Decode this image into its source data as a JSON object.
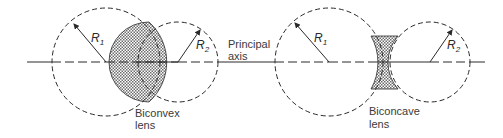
{
  "figure": {
    "axis_label_line1": "Principal",
    "axis_label_line2": "axis",
    "biconvex": {
      "label_line1": "Biconvex",
      "label_line2": "lens",
      "r1": {
        "letter": "R",
        "sub": "1"
      },
      "r2": {
        "letter": "R",
        "sub": "2"
      }
    },
    "biconcave": {
      "label_line1": "Biconcave",
      "label_line2": "lens",
      "r1": {
        "letter": "R",
        "sub": "1"
      },
      "r2": {
        "letter": "R",
        "sub": "2"
      }
    },
    "colors": {
      "line": "#2a2a2a",
      "lens_fill_dark": "#7a7a7a",
      "lens_fill_light": "#ffffff"
    }
  }
}
